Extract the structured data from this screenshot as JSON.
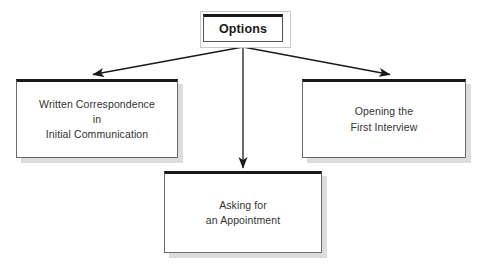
{
  "diagram": {
    "type": "hierarchy-flowchart",
    "background_color": "#ffffff",
    "border_color": "#1a1a1a",
    "text_color": "#333333",
    "connector_color": "#1a1a1a",
    "root": {
      "id": "options",
      "label": "Options"
    },
    "children": [
      {
        "id": "written-correspondence",
        "position": "left",
        "lines": [
          "Written Correspondence",
          "in",
          "Initial Communication"
        ]
      },
      {
        "id": "opening-first-interview",
        "position": "right",
        "lines": [
          "Opening the",
          "First Interview"
        ]
      },
      {
        "id": "asking-for-appointment",
        "position": "bottom",
        "lines": [
          "Asking for",
          "an Appointment"
        ]
      }
    ],
    "connectors": [
      {
        "id": "options-to-left",
        "from": "options",
        "to": "written-correspondence",
        "arrow": "down-left"
      },
      {
        "id": "options-to-bottom",
        "from": "options",
        "to": "asking-for-appointment",
        "arrow": "down"
      },
      {
        "id": "options-to-right",
        "from": "options",
        "to": "opening-first-interview",
        "arrow": "down-right"
      }
    ]
  }
}
